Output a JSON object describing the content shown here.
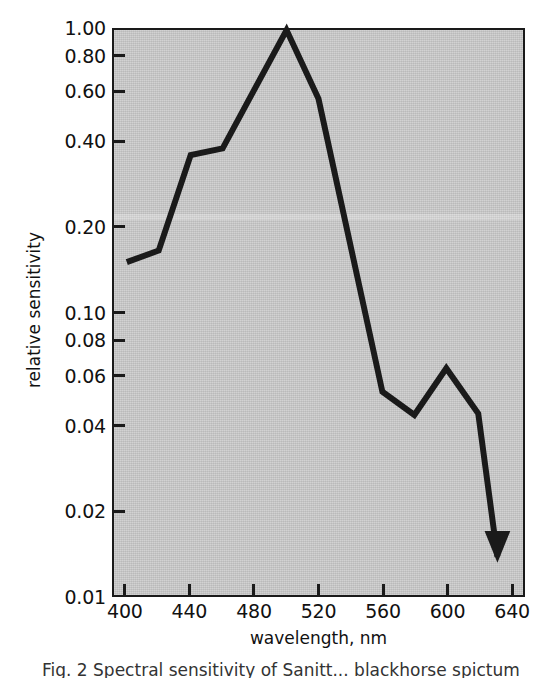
{
  "figure": {
    "caption": "Fig. 2    Spectral sensitivity of Sanitt... blackhorse spictum",
    "background_color": "#ffffff",
    "plot_background_color": "#c9c9c9",
    "frame_color": "#1a1a1a",
    "curve_color": "#1a1a1a"
  },
  "chart_data": {
    "type": "line",
    "title": "",
    "subtitle": "",
    "xlabel": "wavelength, nm",
    "ylabel": "relative sensitivity",
    "xlim": [
      392,
      648
    ],
    "ylim": [
      0.01,
      1.0
    ],
    "yscale": "log",
    "xscale": "linear",
    "grid": false,
    "legend": null,
    "legend_position": "none",
    "xticks": [
      400,
      440,
      480,
      520,
      560,
      600,
      640
    ],
    "xtick_labels": [
      "400",
      "440",
      "480",
      "520",
      "560",
      "600",
      "640"
    ],
    "yticks": [
      1.0,
      0.8,
      0.6,
      0.4,
      0.2,
      0.1,
      0.08,
      0.06,
      0.04,
      0.02,
      0.01
    ],
    "ytick_labels": [
      "1.00",
      "0.80",
      "0.60",
      "0.40",
      "0.20",
      "0.10",
      "0.08",
      "0.06",
      "0.04",
      "0.02",
      "0.01"
    ],
    "series": [
      {
        "name": "relative spectral sensitivity",
        "x": [
          400,
          420,
          440,
          460,
          500,
          520,
          560,
          580,
          600,
          620,
          632
        ],
        "y": [
          0.15,
          0.165,
          0.36,
          0.38,
          1.0,
          0.57,
          0.052,
          0.043,
          0.063,
          0.0435,
          0.0135
        ],
        "line_width": 6,
        "color": "#1a1a1a",
        "markers": "none",
        "end_marker": "downward-arrow",
        "end_marker_note": "arrowhead at 632 nm indicating sensitivity falls below the plotted range"
      }
    ],
    "annotations": [
      {
        "type": "arrow",
        "x": 632,
        "y": 0.0135,
        "direction": "down",
        "note": "upper limit / below detection"
      }
    ]
  }
}
